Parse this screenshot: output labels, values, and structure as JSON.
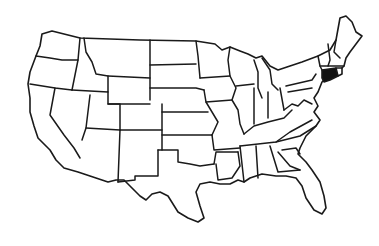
{
  "map": {
    "type": "choropleth-outline",
    "region": "United States (contiguous 48 states)",
    "background": "#ffffff",
    "outline_color": "#1a1a1a",
    "highlight_color": "#111111",
    "highlighted_states": [
      "Connecticut"
    ],
    "labels": []
  }
}
